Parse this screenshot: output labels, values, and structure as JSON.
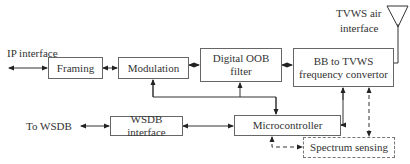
{
  "diagram": {
    "labels": {
      "ip_interface": "IP interface",
      "to_wsdb": "To WSDB",
      "tvws_air_line1": "TVWS air",
      "tvws_air_line2": "interface"
    },
    "blocks": {
      "framing": "Framing",
      "modulation": "Modulation",
      "oob_line1": "Digital OOB",
      "oob_line2": "filter",
      "bb_line1": "BB to TVWS",
      "bb_line2": "frequency convertor",
      "wsdb_interface": "WSDB interface",
      "microcontroller": "Microcontroller",
      "spectrum_sensing": "Spectrum sensing"
    },
    "colors": {
      "line": "#333333",
      "border": "#666666",
      "background": "#ffffff"
    }
  }
}
